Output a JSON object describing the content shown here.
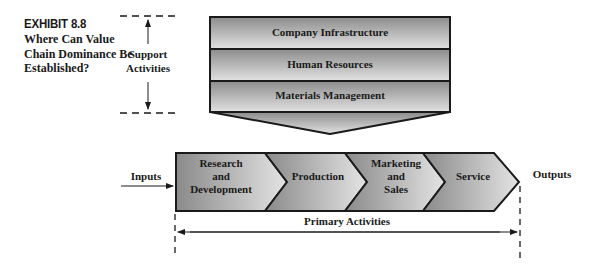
{
  "exhibit": {
    "number": "EXHIBIT 8.8",
    "title": "Where Can Value Chain Dominance Be Established?"
  },
  "support": {
    "label_line1": "Support",
    "label_line2": "Activities",
    "activities": [
      {
        "label": "Company Infrastructure"
      },
      {
        "label": "Human Resources"
      },
      {
        "label": "Materials Management"
      }
    ]
  },
  "primary": {
    "label": "Primary Activities",
    "inputs_label": "Inputs",
    "outputs_label": "Outputs",
    "activities": [
      {
        "line1": "Research",
        "line2": "and",
        "line3": "Development"
      },
      {
        "line1": "Production"
      },
      {
        "line1": "Marketing",
        "line2": "and",
        "line3": "Sales"
      },
      {
        "line1": "Service"
      }
    ]
  },
  "colors": {
    "outline": "#1a1a1a",
    "fill_light": "#e0e0e0",
    "fill_dark": "#8f8f8f"
  }
}
